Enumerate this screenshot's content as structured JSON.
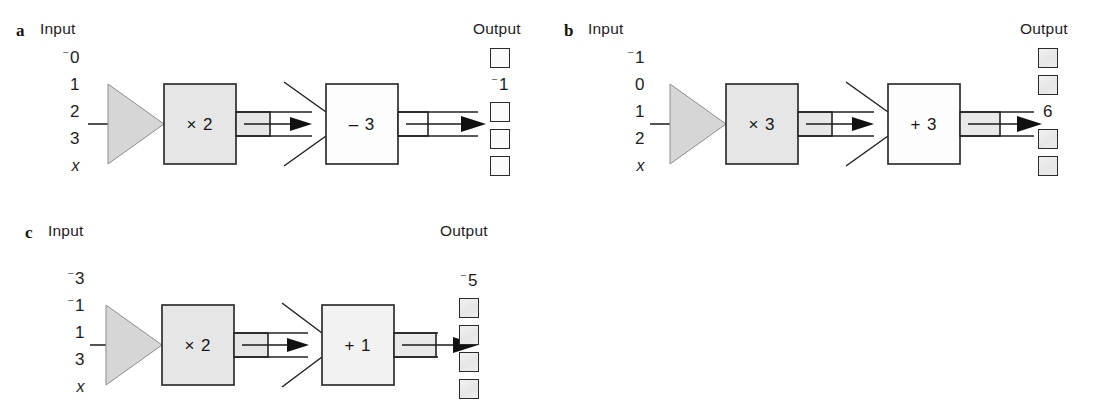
{
  "figure": {
    "title_hidden": "",
    "caption_input": "Input",
    "caption_output": "Output"
  },
  "panels": [
    {
      "letter": "a",
      "caption_input": "Input",
      "caption_output": "Output",
      "inputs": [
        {
          "text": "0",
          "negative": false,
          "italic": false
        },
        {
          "text": "1",
          "negative": false,
          "italic": false
        },
        {
          "text": "2",
          "negative": false,
          "italic": false
        },
        {
          "text": "3",
          "negative": false,
          "italic": false
        },
        {
          "text": "x",
          "negative": false,
          "italic": true
        }
      ],
      "machines": [
        {
          "label": "× 2",
          "style": "filled",
          "funnel": "solid"
        },
        {
          "label": "– 3",
          "style": "hollow",
          "funnel": "open"
        }
      ],
      "outputs": [
        {
          "kind": "box",
          "text": "",
          "negative": false,
          "fill": "plain"
        },
        {
          "kind": "value",
          "text": "1",
          "negative": true
        },
        {
          "kind": "box",
          "text": "",
          "negative": false,
          "fill": "plain"
        },
        {
          "kind": "box",
          "text": "",
          "negative": false,
          "fill": "plain"
        },
        {
          "kind": "box",
          "text": "",
          "negative": false,
          "fill": "plain"
        }
      ]
    },
    {
      "letter": "b",
      "caption_input": "Input",
      "caption_output": "Output",
      "inputs": [
        {
          "text": "1",
          "negative": true,
          "italic": false
        },
        {
          "text": "0",
          "negative": false,
          "italic": false
        },
        {
          "text": "1",
          "negative": false,
          "italic": false
        },
        {
          "text": "2",
          "negative": false,
          "italic": false
        },
        {
          "text": "x",
          "negative": false,
          "italic": true
        }
      ],
      "machines": [
        {
          "label": "× 3",
          "style": "filled",
          "funnel": "solid"
        },
        {
          "label": "+ 3",
          "style": "hollow",
          "funnel": "open"
        }
      ],
      "outputs": [
        {
          "kind": "box",
          "text": "",
          "negative": false,
          "fill": "shaded"
        },
        {
          "kind": "box",
          "text": "",
          "negative": false,
          "fill": "shaded"
        },
        {
          "kind": "value",
          "text": "6",
          "negative": false
        },
        {
          "kind": "box",
          "text": "",
          "negative": false,
          "fill": "shaded"
        },
        {
          "kind": "box",
          "text": "",
          "negative": false,
          "fill": "shaded"
        }
      ]
    },
    {
      "letter": "c",
      "caption_input": "Input",
      "caption_output": "Output",
      "inputs": [
        {
          "text": "3",
          "negative": true,
          "italic": false
        },
        {
          "text": "1",
          "negative": true,
          "italic": false
        },
        {
          "text": "1",
          "negative": false,
          "italic": false
        },
        {
          "text": "3",
          "negative": false,
          "italic": false
        },
        {
          "text": "x",
          "negative": false,
          "italic": true
        }
      ],
      "machines": [
        {
          "label": "× 2",
          "style": "filled",
          "funnel": "solid"
        },
        {
          "label": "+ 1",
          "style": "hollow",
          "funnel": "open"
        }
      ],
      "outputs": [
        {
          "kind": "value",
          "text": "5",
          "negative": true
        },
        {
          "kind": "box",
          "text": "",
          "negative": false,
          "fill": "shaded"
        },
        {
          "kind": "box",
          "text": "",
          "negative": false,
          "fill": "shaded"
        },
        {
          "kind": "box",
          "text": "",
          "negative": false,
          "fill": "shaded"
        },
        {
          "kind": "box",
          "text": "",
          "negative": false,
          "fill": "shaded"
        }
      ]
    }
  ],
  "colors": {
    "ink": "#1b1b1b",
    "machine_fill": "#e6e6e6",
    "machine_stroke": "#2f2f2f",
    "funnel_fill": "#d6d6d6",
    "background": "#ffffff"
  }
}
